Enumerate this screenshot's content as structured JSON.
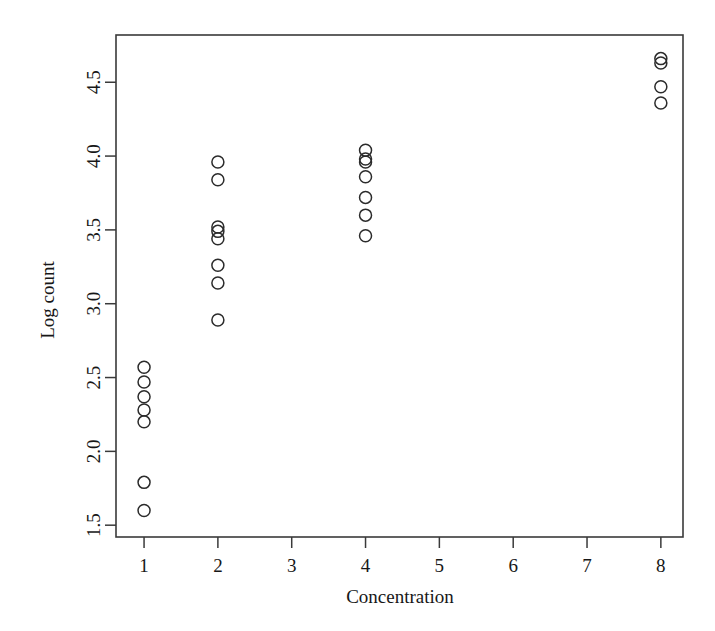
{
  "chart_data": {
    "type": "scatter",
    "title": "",
    "subtitle": "",
    "xlabel": "Concentration",
    "ylabel": "Log count",
    "xlim": [
      0.62,
      8.3
    ],
    "ylim": [
      1.42,
      4.82
    ],
    "xticks": [
      1,
      2,
      3,
      4,
      5,
      6,
      7,
      8
    ],
    "xticklabels": [
      "1",
      "2",
      "3",
      "4",
      "5",
      "6",
      "7",
      "8"
    ],
    "yticks": [
      1.5,
      2.0,
      2.5,
      3.0,
      3.5,
      4.0,
      4.5
    ],
    "yticklabels": [
      "1.5",
      "2.0",
      "2.5",
      "3.0",
      "3.5",
      "4.0",
      "4.5"
    ],
    "grid": false,
    "legend": false,
    "legend_position": "none",
    "marker": "open-circle",
    "marker_color": "#2b2b2b",
    "marker_size": 6,
    "background_color": "#ffffff",
    "frame_color": "#3a3a3a",
    "series": [
      {
        "name": "observations",
        "x": [
          1,
          1,
          1,
          1,
          1,
          1,
          1,
          2,
          2,
          2,
          2,
          2,
          2,
          2,
          2,
          4,
          4,
          4,
          4,
          4,
          4,
          4,
          8,
          8,
          8,
          8
        ],
        "y": [
          2.57,
          2.47,
          2.37,
          2.28,
          2.2,
          1.79,
          1.6,
          3.96,
          3.84,
          3.52,
          3.49,
          3.44,
          3.26,
          3.14,
          2.89,
          4.04,
          3.98,
          3.96,
          3.86,
          3.72,
          3.6,
          3.46,
          4.66,
          4.63,
          4.47,
          4.36
        ]
      }
    ],
    "groups": [
      {
        "concentration": 1,
        "log_counts": [
          2.57,
          2.47,
          2.37,
          2.28,
          2.2,
          1.79,
          1.6
        ]
      },
      {
        "concentration": 2,
        "log_counts": [
          3.96,
          3.84,
          3.52,
          3.49,
          3.44,
          3.26,
          3.14,
          2.89
        ]
      },
      {
        "concentration": 4,
        "log_counts": [
          4.04,
          3.98,
          3.96,
          3.86,
          3.72,
          3.6,
          3.46
        ]
      },
      {
        "concentration": 8,
        "log_counts": [
          4.66,
          4.63,
          4.47,
          4.36
        ]
      }
    ]
  }
}
